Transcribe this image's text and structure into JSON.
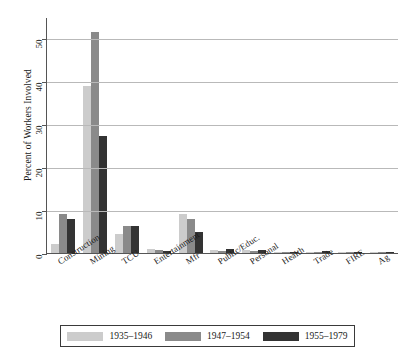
{
  "chart_data": {
    "type": "bar",
    "title": "",
    "xlabel": "",
    "ylabel": "Percent of Workers Involved",
    "ylim": [
      0,
      55
    ],
    "yticks": [
      0,
      10,
      20,
      30,
      40,
      50
    ],
    "grid": true,
    "legend_position": "bottom",
    "categories": [
      "Construction",
      "Mining",
      "TCU",
      "Entertainment",
      "Mfr",
      "Public/Educ.",
      "Personal",
      "Health",
      "Trade",
      "FIRE",
      "Ag"
    ],
    "series": [
      {
        "name": "1935–1946",
        "color": "#cccccc",
        "values": [
          2.0,
          39.0,
          4.5,
          0.9,
          9.2,
          0.8,
          0.6,
          0.15,
          0.1,
          0.1,
          0.05
        ]
      },
      {
        "name": "1947–1954",
        "color": "#8a8a8a",
        "values": [
          9.0,
          51.5,
          6.2,
          0.6,
          8.0,
          0.5,
          0.5,
          0.2,
          0.3,
          0.1,
          0.05
        ]
      },
      {
        "name": "1955–1979",
        "color": "#333333",
        "values": [
          8.0,
          27.2,
          6.2,
          0.4,
          5.0,
          1.0,
          0.6,
          0.3,
          0.5,
          0.2,
          0.1
        ]
      }
    ]
  },
  "legend": {
    "entries": [
      {
        "label": "1935–1946"
      },
      {
        "label": "1947–1954"
      },
      {
        "label": "1955–1979"
      }
    ]
  }
}
